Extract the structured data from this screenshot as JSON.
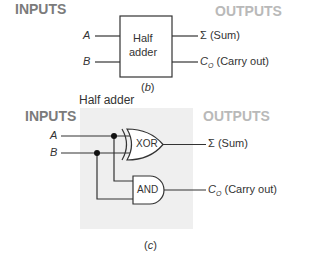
{
  "panel_b": {
    "inputs_label": "INPUTS",
    "outputs_label": "OUTPUTS",
    "input_a": "A",
    "input_b": "B",
    "block_line1": "Half",
    "block_line2": "adder",
    "sum_symbol": "Σ",
    "sum_label": "(Sum)",
    "carry_symbol": "C",
    "carry_sub": "O",
    "carry_label": "(Carry out)",
    "caption_open": "(",
    "caption_letter": "b",
    "caption_close": ")"
  },
  "panel_c": {
    "title": "Half adder",
    "inputs_label": "INPUTS",
    "outputs_label": "OUTPUTS",
    "input_a": "A",
    "input_b": "B",
    "xor_label": "XOR",
    "and_label": "AND",
    "sum_symbol": "Σ",
    "sum_label": "(Sum)",
    "carry_symbol": "C",
    "carry_sub": "O",
    "carry_label": "(Carry out)",
    "caption_open": "(",
    "caption_letter": "c",
    "caption_close": ")"
  },
  "colors": {
    "inputs_text": "#7b7b7b",
    "outputs_text": "#b9b9b9",
    "panel_bg": "#efefef",
    "wire": "#333333"
  }
}
